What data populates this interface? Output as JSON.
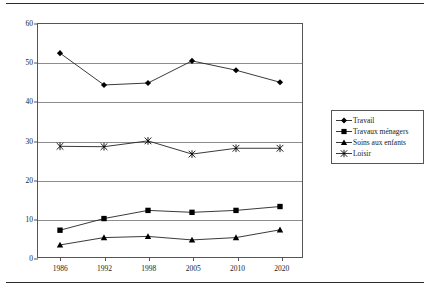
{
  "chart_data": {
    "type": "line",
    "title": "",
    "xlabel": "",
    "ylabel": "",
    "categories": [
      "1986",
      "1992",
      "1998",
      "2005",
      "2010",
      "2020"
    ],
    "yticks": [
      0,
      10,
      20,
      30,
      40,
      50,
      60
    ],
    "ylim": [
      0,
      60
    ],
    "grid": true,
    "legend_position": "right",
    "series": [
      {
        "name": "Travail",
        "marker": "diamond",
        "values": [
          52.5,
          44.3,
          44.8,
          50.5,
          48.1,
          45.0
        ]
      },
      {
        "name": "Travaux ménagers",
        "marker": "square",
        "values": [
          6.9,
          9.9,
          12.0,
          11.5,
          12.0,
          13.0
        ]
      },
      {
        "name": "Soins aux enfants",
        "marker": "triangle",
        "values": [
          3.1,
          5.0,
          5.3,
          4.4,
          5.0,
          7.0
        ]
      },
      {
        "name": "Loisir",
        "marker": "star",
        "values": [
          28.5,
          28.4,
          29.9,
          26.5,
          28.0,
          28.0
        ]
      }
    ]
  },
  "colors": {
    "line": "#222222",
    "marker": "#000000",
    "grid": "#8d8d8d",
    "frame": "#555555",
    "rule": "#2b2b2b",
    "text": "#1a1a1a"
  }
}
